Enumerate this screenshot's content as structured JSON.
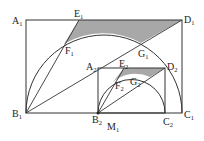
{
  "diagram": {
    "title": "",
    "colors": {
      "stroke": "#333333",
      "shade": "#a8a8a8",
      "background": "#ffffff"
    },
    "labels": {
      "A1": {
        "base": "A",
        "sub": "1"
      },
      "B1": {
        "base": "B",
        "sub": "1"
      },
      "C1": {
        "base": "C",
        "sub": "1"
      },
      "D1": {
        "base": "D",
        "sub": "1"
      },
      "E1": {
        "base": "E",
        "sub": "1"
      },
      "F1": {
        "base": "F",
        "sub": "1"
      },
      "G1": {
        "base": "G",
        "sub": "1"
      },
      "A2": {
        "base": "A",
        "sub": "2"
      },
      "B2": {
        "base": "B",
        "sub": "2"
      },
      "C2": {
        "base": "C",
        "sub": "2"
      },
      "D2": {
        "base": "D",
        "sub": "2"
      },
      "E2": {
        "base": "E",
        "sub": "2"
      },
      "F2": {
        "base": "F",
        "sub": "2"
      },
      "G2": {
        "base": "G",
        "sub": "2"
      },
      "M1": {
        "base": "M",
        "sub": "1"
      }
    },
    "shapes": [
      {
        "type": "rectangle",
        "vertices": [
          "A1",
          "B1",
          "C1",
          "D1"
        ]
      },
      {
        "type": "rectangle",
        "vertices": [
          "A2",
          "B2",
          "C2",
          "D2"
        ]
      },
      {
        "type": "semicircle",
        "diameter": [
          "B1",
          "C1"
        ]
      },
      {
        "type": "semicircle",
        "diameter": [
          "B2",
          "C2"
        ]
      },
      {
        "type": "segment",
        "points": [
          "B1",
          "D1"
        ]
      },
      {
        "type": "segment",
        "points": [
          "B1",
          "E1"
        ]
      },
      {
        "type": "segment",
        "points": [
          "B2",
          "D2"
        ]
      },
      {
        "type": "segment",
        "points": [
          "B2",
          "E2"
        ]
      },
      {
        "type": "shaded-region",
        "bounded_by": [
          "E1",
          "D1",
          "G1",
          "F1"
        ]
      },
      {
        "type": "shaded-region",
        "bounded_by": [
          "E2",
          "D2",
          "G2",
          "F2"
        ]
      }
    ]
  }
}
